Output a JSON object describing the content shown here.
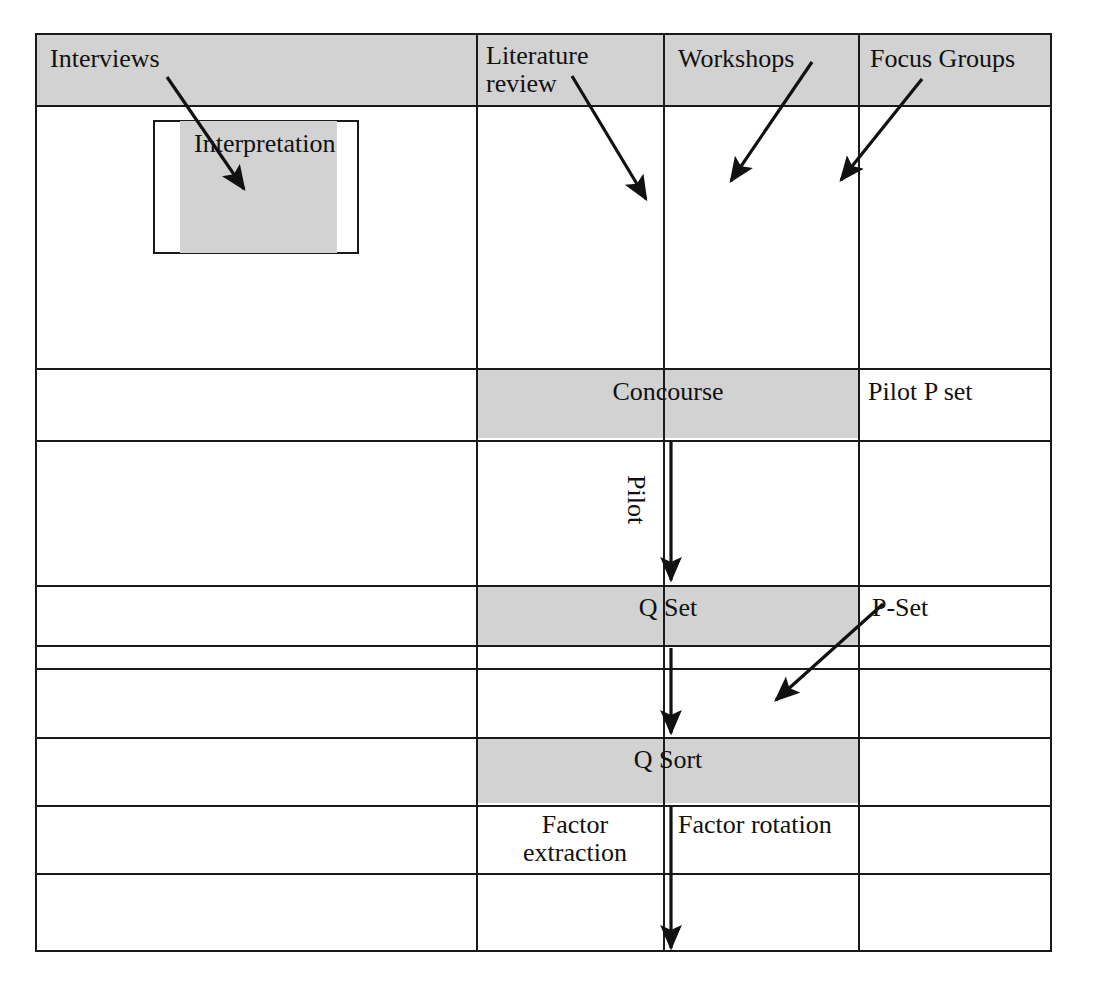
{
  "diagram": {
    "colors": {
      "shade": "#d2d2d2",
      "line": "#1a1a1a",
      "background": "#ffffff",
      "text": "#111111"
    },
    "columns": [
      {
        "name": "column-1"
      },
      {
        "name": "column-2"
      },
      {
        "name": "column-3"
      },
      {
        "name": "column-4"
      }
    ],
    "headers": [
      {
        "id": "interviews",
        "label": "Interviews"
      },
      {
        "id": "literature-review",
        "label": "Literature\nreview"
      },
      {
        "id": "workshops",
        "label": "Workshops"
      },
      {
        "id": "focus-groups",
        "label": "Focus Groups"
      }
    ],
    "nodes": [
      {
        "id": "interpretation",
        "label": "Interpretation",
        "shaded": true
      },
      {
        "id": "concourse",
        "label": "Concourse",
        "shaded": true
      },
      {
        "id": "pilot-p-set",
        "label": "Pilot P set",
        "shaded": false
      },
      {
        "id": "q-set",
        "label": "Q Set",
        "shaded": true
      },
      {
        "id": "q-sort",
        "label": "Q Sort",
        "shaded": true
      },
      {
        "id": "p-set",
        "label": "P-Set",
        "shaded": false
      },
      {
        "id": "factor-extraction",
        "label": "Factor\nextraction",
        "shaded": false
      },
      {
        "id": "factor-rotation",
        "label": "Factor rotation",
        "shaded": false
      }
    ],
    "edges": [
      {
        "id": "interviews-to-interpretation",
        "label": "",
        "from": "interviews",
        "to": "interpretation"
      },
      {
        "id": "literature-review-down",
        "label": "",
        "from": "literature-review",
        "to": "concourse"
      },
      {
        "id": "workshops-down",
        "label": "",
        "from": "workshops",
        "to": "concourse"
      },
      {
        "id": "focus-groups-down",
        "label": "",
        "from": "focus-groups",
        "to": "concourse"
      },
      {
        "id": "concourse-to-q-set",
        "label": "Pilot",
        "from": "concourse",
        "to": "q-set"
      },
      {
        "id": "q-set-to-q-sort",
        "label": "",
        "from": "q-set",
        "to": "q-sort"
      },
      {
        "id": "p-set-to-q-sort",
        "label": "",
        "from": "p-set",
        "to": "q-sort"
      },
      {
        "id": "q-sort-to-factors",
        "label": "",
        "from": "q-sort",
        "to": "factor-extraction"
      }
    ]
  }
}
